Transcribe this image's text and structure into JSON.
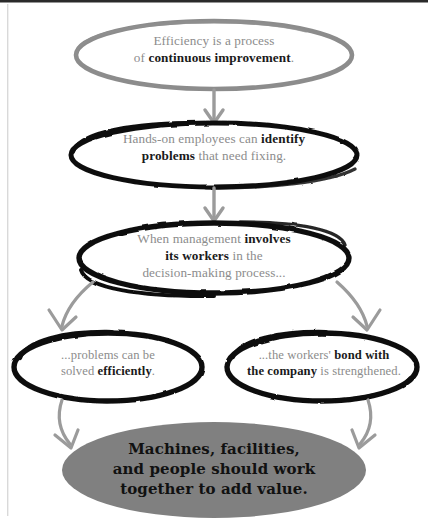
{
  "diagram": {
    "colors": {
      "gray_stroke": "#8c8c8c",
      "black_stroke": "#111111",
      "arrow_gray": "#9b9b9b",
      "gray_fill": "#808080",
      "body_text": "#8c8c8c",
      "emphasis_text": "#1a1a1a",
      "background": "#ffffff"
    },
    "nodes": [
      {
        "id": "node-1",
        "shape": "ellipse",
        "style": "gray-outline",
        "text_plain": "Efficiency is a process of continuous improvement.",
        "text_html": "Efficiency is a process<br>of <b>continuous improvement</b>."
      },
      {
        "id": "node-2",
        "shape": "ellipse",
        "style": "black-outline",
        "text_plain": "Hands-on employees can identify problems that need fixing.",
        "text_html": "Hands-on employees can <b>identify</b><br><b>problems</b> that need fixing."
      },
      {
        "id": "node-3",
        "shape": "ellipse",
        "style": "black-outline",
        "text_plain": "When management involves its workers in the decision-making process...",
        "text_html": "When management <b>involves</b><br><b>its workers</b> in the<br>decision-making process..."
      },
      {
        "id": "node-4",
        "shape": "ellipse",
        "style": "black-outline",
        "text_plain": "...problems can be solved efficiently.",
        "text_html": "...problems can be<br>solved <b>efficiently</b>."
      },
      {
        "id": "node-5",
        "shape": "ellipse",
        "style": "black-outline",
        "text_plain": "...the workers' bond with the company is strengthened.",
        "text_html": "...the workers' <b>bond with</b><br><b>the company</b> is strengthened."
      },
      {
        "id": "node-6",
        "shape": "ellipse",
        "style": "gray-filled",
        "text_plain": "Machines, facilities, and people should work together to add value.",
        "text_html": "Machines, facilities,<br>and people should work<br>together to add value."
      }
    ],
    "connectors": [
      {
        "id": "arrow-1",
        "from": "node-1",
        "to": "node-2",
        "direction": "down"
      },
      {
        "id": "arrow-2",
        "from": "node-2",
        "to": "node-3",
        "direction": "down"
      },
      {
        "id": "arrow-3",
        "from": "node-3",
        "to": "node-4",
        "direction": "down-left"
      },
      {
        "id": "arrow-4",
        "from": "node-3",
        "to": "node-5",
        "direction": "down-right"
      },
      {
        "id": "arrow-5",
        "from": "node-4",
        "to": "node-6",
        "direction": "down-right"
      },
      {
        "id": "arrow-6",
        "from": "node-5",
        "to": "node-6",
        "direction": "down-left"
      }
    ]
  }
}
